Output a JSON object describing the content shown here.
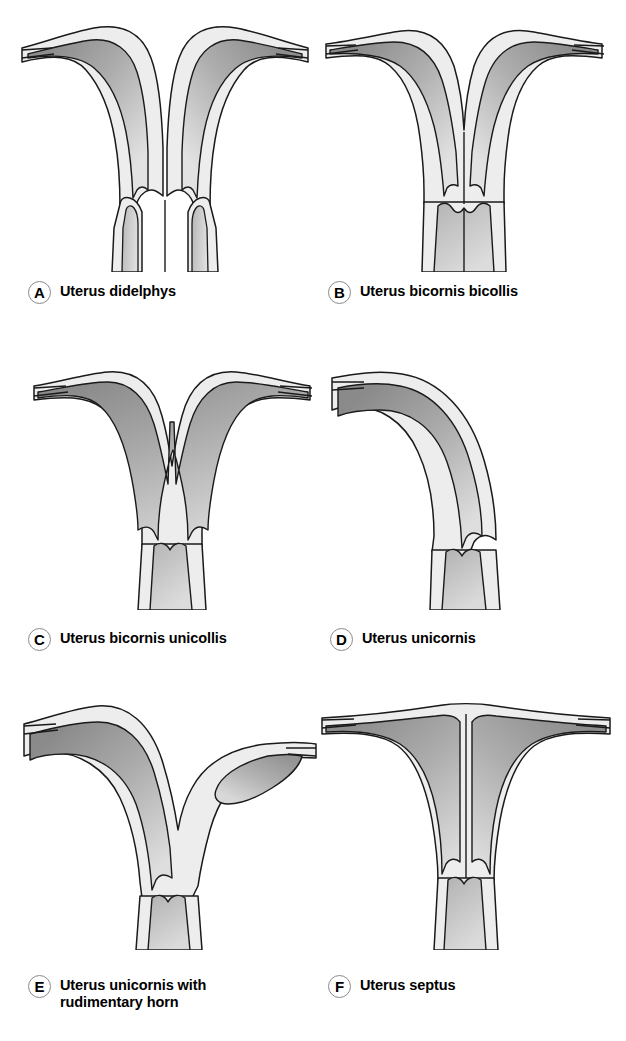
{
  "figure": {
    "background_color": "#ffffff",
    "outline_color": "#1a1a1a",
    "myometrium_color": "#ededed",
    "endometrium_color": "#a2a2a2",
    "badge_border_color": "#8a8a8a"
  },
  "panels": [
    {
      "key": "A",
      "badge": "A",
      "label": "Uterus didelphys",
      "description": "Two entirely separate uterine horns, each with its own endometrial cavity, cervix and cervical canal; complete failure of müllerian duct fusion.",
      "horns": 2,
      "cervices": 2,
      "cavities": 2,
      "fallopian_tubes": 2,
      "septum": false,
      "rudimentary_horn": false
    },
    {
      "key": "B",
      "badge": "B",
      "label": "Uterus bicornis bicollis",
      "description": "Two divergent uterine horns that join at a common lower body but retain two cervical canals.",
      "horns": 2,
      "cervices": 2,
      "cavities": 2,
      "fallopian_tubes": 2,
      "septum": false,
      "rudimentary_horn": false
    },
    {
      "key": "C",
      "badge": "C",
      "label": "Uterus bicornis unicollis",
      "description": "Two uterine horns converging into a single Y-shaped cavity with one cervix.",
      "horns": 2,
      "cervices": 1,
      "cavities": 1,
      "fallopian_tubes": 2,
      "septum": false,
      "rudimentary_horn": false
    },
    {
      "key": "D",
      "badge": "D",
      "label": "Uterus unicornis",
      "description": "A single banana-shaped uterine horn with one fallopian tube and one cervix.",
      "horns": 1,
      "cervices": 1,
      "cavities": 1,
      "fallopian_tubes": 1,
      "septum": false,
      "rudimentary_horn": false
    },
    {
      "key": "E",
      "badge": "E",
      "label": "Uterus unicornis with\nrudimentary horn",
      "description": "A dominant unicornuate horn with a small non-communicating rudimentary horn on the opposite side.",
      "horns": 1,
      "cervices": 1,
      "cavities": 2,
      "fallopian_tubes": 2,
      "septum": false,
      "rudimentary_horn": true
    },
    {
      "key": "F",
      "badge": "F",
      "label": "Uterus septus",
      "description": "Normal external uterine contour with a longitudinal septum dividing the endometrial cavity down to the cervix.",
      "horns": 1,
      "cervices": 1,
      "cavities": 2,
      "fallopian_tubes": 2,
      "septum": true,
      "rudimentary_horn": false
    }
  ]
}
